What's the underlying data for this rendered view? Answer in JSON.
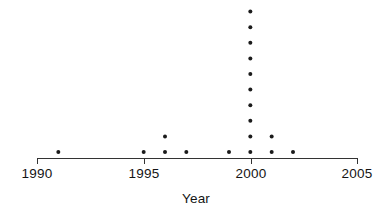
{
  "chart_data": {
    "type": "scatter",
    "plot_style": "dot-plot",
    "title": "",
    "subtitle": "",
    "xlabel": "Year",
    "ylabel": "",
    "xlim": [
      1990,
      2005
    ],
    "xticks": [
      1990,
      1995,
      2000,
      2005
    ],
    "xticklabels": [
      "1990",
      "1995",
      "2000",
      "2005"
    ],
    "ylim": [
      0,
      11
    ],
    "grid": false,
    "legend": null,
    "annotations": [],
    "categories": [
      1991,
      1995,
      1996,
      1997,
      1999,
      2000,
      2001,
      2002
    ],
    "values": [
      1,
      1,
      2,
      1,
      1,
      10,
      2,
      1
    ],
    "points": [
      {
        "x": 1991,
        "stack": 1
      },
      {
        "x": 1995,
        "stack": 1
      },
      {
        "x": 1996,
        "stack": 1
      },
      {
        "x": 1996,
        "stack": 2
      },
      {
        "x": 1997,
        "stack": 1
      },
      {
        "x": 1999,
        "stack": 1
      },
      {
        "x": 2000,
        "stack": 1
      },
      {
        "x": 2000,
        "stack": 2
      },
      {
        "x": 2000,
        "stack": 3
      },
      {
        "x": 2000,
        "stack": 4
      },
      {
        "x": 2000,
        "stack": 5
      },
      {
        "x": 2000,
        "stack": 6
      },
      {
        "x": 2000,
        "stack": 7
      },
      {
        "x": 2000,
        "stack": 8
      },
      {
        "x": 2000,
        "stack": 9
      },
      {
        "x": 2000,
        "stack": 10
      },
      {
        "x": 2001,
        "stack": 1
      },
      {
        "x": 2001,
        "stack": 2
      },
      {
        "x": 2002,
        "stack": 1
      }
    ],
    "total_points": 19,
    "dot_color": "#1b1b1b",
    "axis_color": "#333333"
  },
  "labels": {
    "axis_title": "Year",
    "tick_1990": "1990",
    "tick_1995": "1995",
    "tick_2000": "2000",
    "tick_2005": "2005"
  }
}
